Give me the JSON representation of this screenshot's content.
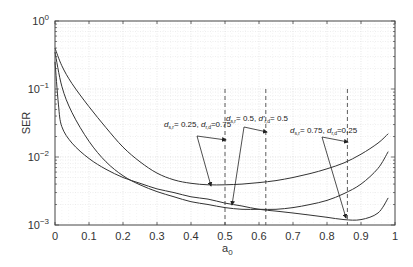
{
  "chart_data": {
    "type": "line",
    "title": "",
    "xlabel": "a0",
    "ylabel": "SER",
    "xscale": "linear",
    "yscale": "log",
    "xlim": [
      0,
      1
    ],
    "ylim": [
      0.001,
      1
    ],
    "grid": true,
    "legend": "none (curves identified by arrow annotations)",
    "x_ticks": [
      "0",
      "0.1",
      "0.2",
      "0.3",
      "0.4",
      "0.5",
      "0.6",
      "0.7",
      "0.8",
      "0.9",
      "1"
    ],
    "y_ticks": [
      "10^-3",
      "10^-2",
      "10^-1",
      "10^0"
    ],
    "series": [
      {
        "name": "d_s,r = 0.25, d_r,d = 0.75",
        "x": [
          0.0,
          0.02,
          0.05,
          0.1,
          0.15,
          0.2,
          0.25,
          0.3,
          0.35,
          0.4,
          0.45,
          0.5,
          0.55,
          0.6,
          0.65,
          0.7,
          0.75,
          0.8,
          0.85,
          0.9,
          0.95,
          0.98
        ],
        "values": [
          0.4,
          0.22,
          0.12,
          0.055,
          0.027,
          0.014,
          0.0085,
          0.0058,
          0.0046,
          0.0041,
          0.0039,
          0.0039,
          0.004,
          0.0042,
          0.0045,
          0.005,
          0.0057,
          0.0067,
          0.0082,
          0.011,
          0.016,
          0.022
        ]
      },
      {
        "name": "d_s,r = 0.5, d'_r,d = 0.5",
        "x": [
          0.0,
          0.02,
          0.05,
          0.1,
          0.15,
          0.2,
          0.25,
          0.3,
          0.35,
          0.4,
          0.45,
          0.5,
          0.55,
          0.6,
          0.65,
          0.7,
          0.75,
          0.8,
          0.85,
          0.9,
          0.95,
          0.98
        ],
        "values": [
          0.35,
          0.11,
          0.045,
          0.017,
          0.0085,
          0.0053,
          0.0039,
          0.0031,
          0.0026,
          0.0022,
          0.002,
          0.0018,
          0.0017,
          0.0017,
          0.0017,
          0.0018,
          0.002,
          0.0023,
          0.0029,
          0.004,
          0.0068,
          0.012
        ]
      },
      {
        "name": "d_s,r = 0.75, d_r,d = 0.25",
        "x": [
          0.0,
          0.01,
          0.02,
          0.05,
          0.1,
          0.15,
          0.2,
          0.25,
          0.3,
          0.35,
          0.4,
          0.45,
          0.5,
          0.55,
          0.6,
          0.65,
          0.7,
          0.75,
          0.8,
          0.85,
          0.9,
          0.95,
          0.98
        ],
        "values": [
          0.25,
          0.06,
          0.028,
          0.016,
          0.0095,
          0.0066,
          0.005,
          0.0041,
          0.0034,
          0.003,
          0.0026,
          0.0024,
          0.0021,
          0.0019,
          0.0017,
          0.0016,
          0.0015,
          0.0014,
          0.0013,
          0.0012,
          0.0012,
          0.0015,
          0.0025
        ]
      }
    ],
    "annotations": [
      {
        "text": "d_s,r = 0.25, d_r,d = 0.75",
        "points_to_series": 0,
        "marker_x": 0.5,
        "min_at_x": 0.46
      },
      {
        "text": "d_s,r = 0.5, d'_r,d = 0.5",
        "points_to_series": 1,
        "marker_x": 0.62,
        "min_at_x": 0.52
      },
      {
        "text": "d_s,r = 0.75, d_r,d = 0.25",
        "points_to_series": 2,
        "marker_x": 0.86,
        "min_at_x": 0.86
      }
    ],
    "vertical_dashed_lines_x": [
      0.5,
      0.62,
      0.86
    ]
  },
  "labels": {
    "ylabel": "SER",
    "xlabel_base": "a",
    "xlabel_sub": "0",
    "ann1_val1": "= 0.25,",
    "ann1_val2": "=0.75",
    "ann2_val1": "= 0.5,",
    "ann2_val2": "= 0.5",
    "ann3_val1": "= 0.75,",
    "ann3_val2": "=0.25"
  }
}
